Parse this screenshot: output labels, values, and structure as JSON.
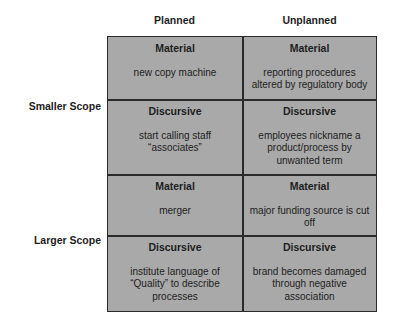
{
  "columns": [
    "Planned",
    "Unplanned"
  ],
  "rows": [
    "Smaller Scope",
    "Larger Scope"
  ],
  "cells": [
    {
      "kind": "Material",
      "desc": "new copy machine"
    },
    {
      "kind": "Material",
      "desc": "reporting procedures altered by regulatory body"
    },
    {
      "kind": "Discursive",
      "desc": "start calling staff “associates”"
    },
    {
      "kind": "Discursive",
      "desc": "employees nickname a product/process by unwanted term"
    },
    {
      "kind": "Material",
      "desc": "merger"
    },
    {
      "kind": "Material",
      "desc": "major funding source is cut off"
    },
    {
      "kind": "Discursive",
      "desc": "institute language of “Quality” to describe processes"
    },
    {
      "kind": "Discursive",
      "desc": "brand becomes damaged through negative association"
    }
  ],
  "colors": {
    "cell_fill": "#a9a9a9",
    "border": "#2a2a2a"
  }
}
